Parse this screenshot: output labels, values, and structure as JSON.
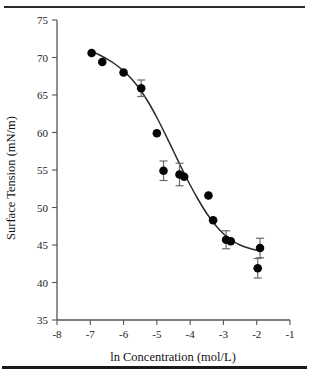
{
  "figure": {
    "name": "surface-tension-vs-ln-concentration",
    "top_rule": true,
    "bottom_rule": true
  },
  "chart_data": {
    "type": "scatter",
    "title": "",
    "xlabel": "ln Concentration (mol/L)",
    "ylabel": "Surface Tension (mN/m)",
    "xlim": [
      -8,
      -1
    ],
    "ylim": [
      35,
      75
    ],
    "xticks": [
      -8,
      -7,
      -6,
      -5,
      -4,
      -3,
      -2,
      -1
    ],
    "xticklabels": [
      "-8",
      "-7",
      "-6",
      "-5",
      "-4",
      "-3",
      "-2",
      "-1"
    ],
    "yticks": [
      35,
      40,
      45,
      50,
      55,
      60,
      65,
      70,
      75
    ],
    "yticklabels": [
      "35",
      "40",
      "45",
      "50",
      "55",
      "60",
      "65",
      "70",
      "75"
    ],
    "grid": false,
    "legend": null,
    "marker": "filled-circle",
    "marker_color": "#050505",
    "curve_color": "#2a2a2a",
    "errorbar_color": "#6a6a6a",
    "points": [
      {
        "x": -6.96,
        "y": 70.6,
        "yerr": 0.0
      },
      {
        "x": -6.64,
        "y": 69.4,
        "yerr": 0.0
      },
      {
        "x": -6.0,
        "y": 68.0,
        "yerr": 0.0
      },
      {
        "x": -5.47,
        "y": 65.9,
        "yerr": 1.1
      },
      {
        "x": -5.0,
        "y": 59.9,
        "yerr": 0.0
      },
      {
        "x": -4.8,
        "y": 54.9,
        "yerr": 1.3
      },
      {
        "x": -4.32,
        "y": 54.4,
        "yerr": 1.5
      },
      {
        "x": -4.18,
        "y": 54.1,
        "yerr": 0.0
      },
      {
        "x": -3.45,
        "y": 51.6,
        "yerr": 0.0
      },
      {
        "x": -3.31,
        "y": 48.3,
        "yerr": 0.0
      },
      {
        "x": -2.92,
        "y": 45.7,
        "yerr": 1.2
      },
      {
        "x": -2.78,
        "y": 45.5,
        "yerr": 0.0
      },
      {
        "x": -1.97,
        "y": 41.9,
        "yerr": 1.3
      },
      {
        "x": -1.9,
        "y": 44.6,
        "yerr": 1.3
      }
    ],
    "curve": [
      {
        "x": -7.0,
        "y": 70.9
      },
      {
        "x": -6.75,
        "y": 70.4
      },
      {
        "x": -6.5,
        "y": 69.8
      },
      {
        "x": -6.25,
        "y": 69.1
      },
      {
        "x": -6.0,
        "y": 68.2
      },
      {
        "x": -5.75,
        "y": 67.1
      },
      {
        "x": -5.5,
        "y": 65.7
      },
      {
        "x": -5.25,
        "y": 64.0
      },
      {
        "x": -5.0,
        "y": 62.0
      },
      {
        "x": -4.75,
        "y": 59.8
      },
      {
        "x": -4.5,
        "y": 57.5
      },
      {
        "x": -4.25,
        "y": 55.2
      },
      {
        "x": -4.0,
        "y": 53.0
      },
      {
        "x": -3.75,
        "y": 51.0
      },
      {
        "x": -3.5,
        "y": 49.2
      },
      {
        "x": -3.25,
        "y": 47.7
      },
      {
        "x": -3.0,
        "y": 46.5
      },
      {
        "x": -2.75,
        "y": 45.6
      },
      {
        "x": -2.5,
        "y": 45.0
      },
      {
        "x": -2.25,
        "y": 44.6
      },
      {
        "x": -2.0,
        "y": 44.3
      },
      {
        "x": -1.85,
        "y": 44.2
      }
    ]
  }
}
